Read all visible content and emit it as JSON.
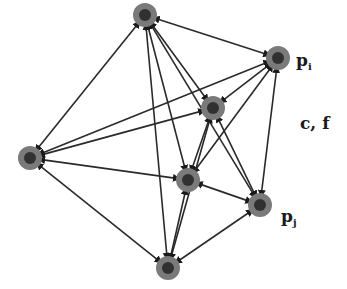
{
  "diagram": {
    "type": "directed-graph",
    "nodes": [
      {
        "id": "top",
        "x": 145,
        "y": 15,
        "label": ""
      },
      {
        "id": "pi",
        "x": 278,
        "y": 58,
        "label": "p_i"
      },
      {
        "id": "inner_upper",
        "x": 213,
        "y": 108,
        "label": ""
      },
      {
        "id": "left",
        "x": 30,
        "y": 158,
        "label": ""
      },
      {
        "id": "inner_lower",
        "x": 188,
        "y": 180,
        "label": ""
      },
      {
        "id": "pj",
        "x": 260,
        "y": 205,
        "label": "p_j"
      },
      {
        "id": "bottom",
        "x": 168,
        "y": 268,
        "label": ""
      }
    ],
    "edges": [
      [
        "top",
        "pi"
      ],
      [
        "top",
        "left"
      ],
      [
        "top",
        "bottom"
      ],
      [
        "top",
        "inner_lower"
      ],
      [
        "top",
        "pj"
      ],
      [
        "top",
        "inner_upper"
      ],
      [
        "pi",
        "left"
      ],
      [
        "pi",
        "inner_upper"
      ],
      [
        "pi",
        "inner_lower"
      ],
      [
        "pi",
        "pj"
      ],
      [
        "left",
        "inner_upper"
      ],
      [
        "left",
        "inner_lower"
      ],
      [
        "left",
        "bottom"
      ],
      [
        "inner_upper",
        "pj"
      ],
      [
        "inner_upper",
        "inner_lower"
      ],
      [
        "inner_upper",
        "bottom"
      ],
      [
        "inner_lower",
        "pj"
      ],
      [
        "inner_lower",
        "bottom"
      ],
      [
        "pj",
        "bottom"
      ]
    ],
    "colors": {
      "node_fill": "#7a7a7a",
      "node_dark": "#1a1a1a",
      "edge": "#2a2a2a"
    },
    "labels": {
      "pi_main": "p",
      "pi_sub": "i",
      "pj_main": "p",
      "pj_sub": "j",
      "cf": "c, f"
    }
  }
}
